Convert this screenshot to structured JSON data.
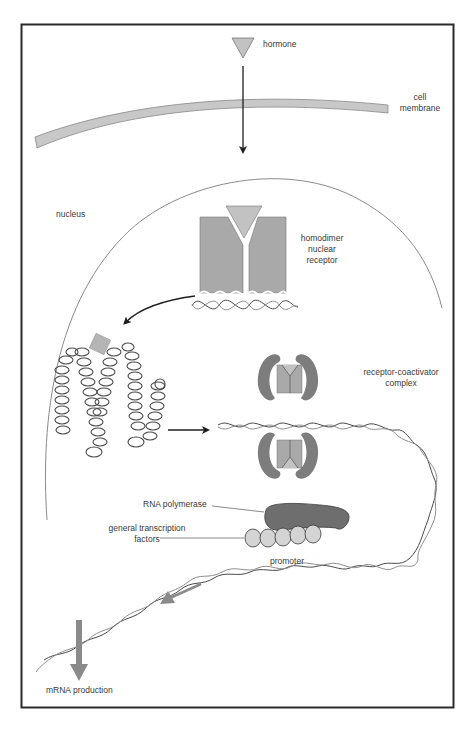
{
  "diagram": {
    "type": "hormone nuclear receptor signaling pathway",
    "labels": {
      "hormone": "hormone",
      "cell_membrane_line1": "cell",
      "cell_membrane_line2": "membrane",
      "nucleus": "nucleus",
      "homodimer_line1": "homodimer",
      "homodimer_line2": "nuclear",
      "homodimer_line3": "receptor",
      "coactivator_line1": "receptor-coactivator",
      "coactivator_line2": "complex",
      "rna_polymerase": "RNA polymerase",
      "gtf_line1": "general transcription",
      "gtf_line2": "factors",
      "promoter": "promoter",
      "mrna": "mRNA production"
    },
    "colors": {
      "frame": "#2a2a2a",
      "membrane_fill": "#c8c8c8",
      "receptor_fill": "#a9a9a9",
      "hormone_fill": "#c2c2c2",
      "coactivator_fill": "#7d7d7d",
      "polymerase_fill": "#6e6e6e",
      "gtf_fill": "#d4d4d4",
      "dna_dark": "#4a4a4a",
      "dna_light": "#8e8e8e",
      "arrow_dark": "#1e1e1e",
      "arrow_gray": "#8a8a8a",
      "nucleus_line": "#8a8a8a"
    }
  }
}
